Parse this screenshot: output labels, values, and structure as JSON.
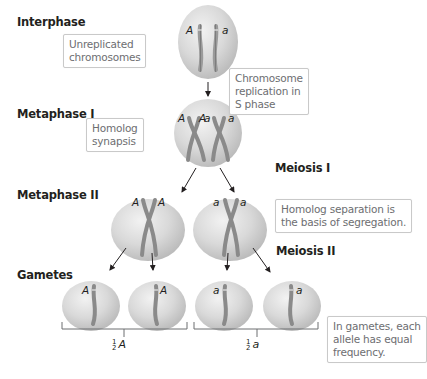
{
  "stages": {
    "interphase": "Interphase",
    "metaphase1": "Metaphase I",
    "meiosis1": "Meiosis I",
    "metaphase2": "Metaphase II",
    "meiosis2": "Meiosis II",
    "gametes": "Gametes"
  },
  "notes": {
    "unreplicated": [
      "Unreplicated",
      "chromosomes"
    ],
    "replication": [
      "Chromosome",
      "replication in",
      "S phase"
    ],
    "synapsis": [
      "Homolog",
      "synapsis"
    ],
    "segregation": [
      "Homolog separation is",
      "the basis of segregation."
    ],
    "frequency": [
      "In gametes, each",
      "allele has equal",
      "frequency."
    ]
  },
  "alleles": {
    "dominant": "A",
    "recessive": "a"
  },
  "fractions": {
    "left": {
      "num": "1",
      "den": "2",
      "allele": "A"
    },
    "right": {
      "num": "1",
      "den": "2",
      "allele": "a"
    }
  },
  "colors": {
    "cell": "#d8d8d8",
    "cell_edge": "#b9b9b9",
    "chromosome": "#8a8a8a",
    "centromere_mark": "#e7e7e7",
    "arrow": "#231f20",
    "note_border": "#c9c9c9",
    "note_text": "#6d6e71"
  }
}
